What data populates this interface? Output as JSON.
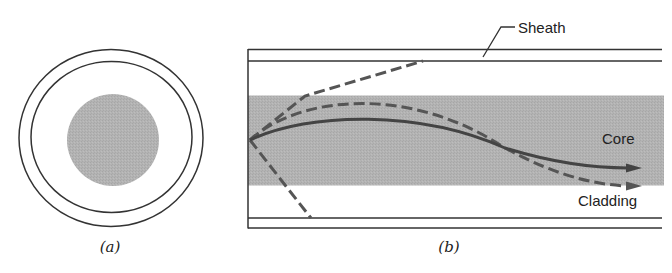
{
  "figure": {
    "panel_a": {
      "caption": "(a)",
      "description": "Cross-section of optical fiber",
      "layers": [
        "sheath",
        "cladding",
        "core"
      ]
    },
    "panel_b": {
      "caption": "(b)",
      "description": "Longitudinal section showing ray paths",
      "labels": {
        "sheath": "Sheath",
        "core": "Core",
        "cladding": "Cladding"
      }
    }
  },
  "colors": {
    "line": "#333333",
    "core_fill": "#b3b3b3",
    "ray": "#555555",
    "background": "#ffffff"
  }
}
